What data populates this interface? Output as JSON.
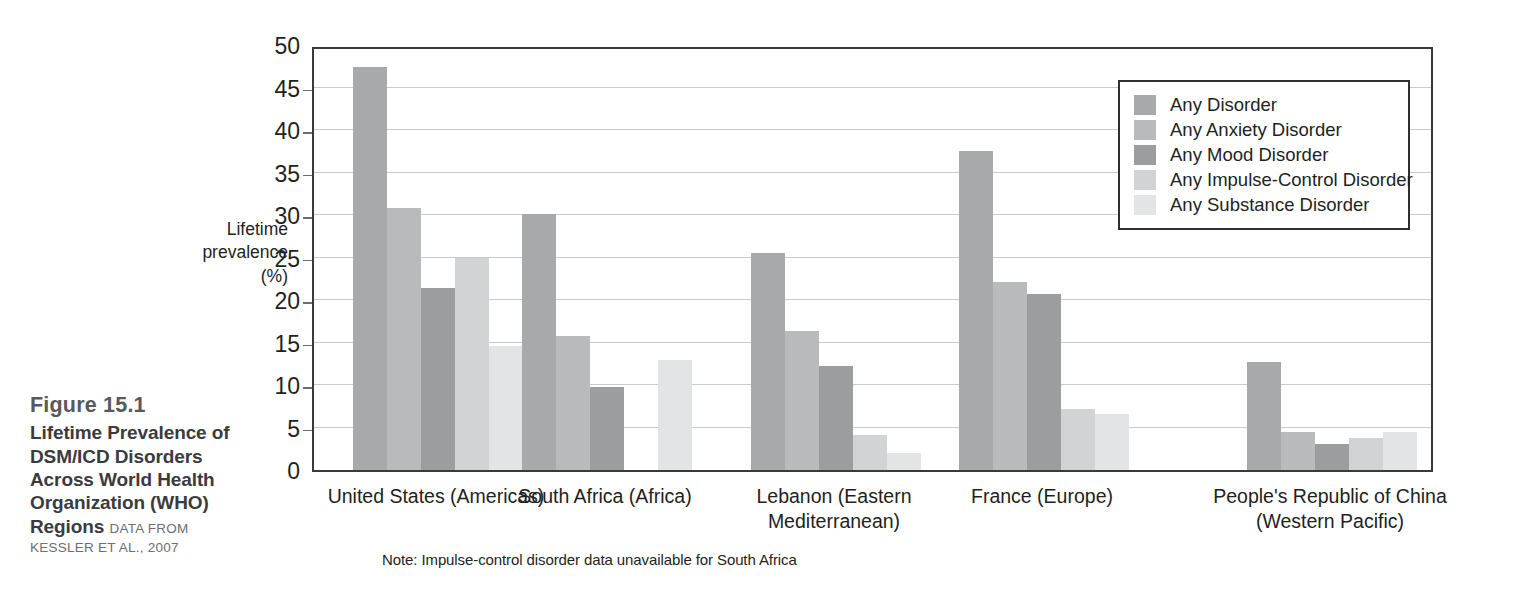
{
  "figure": {
    "number": "Figure 15.1",
    "title": "Lifetime Prevalence of DSM/ICD Disorders Across World Health Organization (WHO) Regions",
    "source_lead": "DATA FROM",
    "source_rest": "KESSLER ET AL., 2007"
  },
  "note": "Note: Impulse-control disorder data unavailable for South Africa",
  "chart_data": {
    "type": "bar",
    "title": "",
    "xlabel": "",
    "ylabel": "Lifetime prevalence (%)",
    "ylim": [
      0,
      50
    ],
    "yticks": [
      0,
      5,
      10,
      15,
      20,
      25,
      30,
      35,
      40,
      45,
      50
    ],
    "grid": true,
    "legend_position": "top-right",
    "categories": [
      "United States (Americas)",
      "South Africa (Africa)",
      "Lebanon (Eastern Mediterranean)",
      "France (Europe)",
      "People's Republic of China (Western Pacific)"
    ],
    "category_lines": [
      [
        "United States (Americas)"
      ],
      [
        "South Africa (Africa)"
      ],
      [
        "Lebanon (Eastern",
        "Mediterranean)"
      ],
      [
        "France (Europe)"
      ],
      [
        "People's Republic of China",
        "(Western Pacific)"
      ]
    ],
    "series": [
      {
        "name": "Any Disorder",
        "color": "#a8a9ab",
        "values": [
          47.4,
          30.1,
          25.5,
          37.5,
          12.7
        ]
      },
      {
        "name": "Any Anxiety Disorder",
        "color": "#b9babc",
        "values": [
          30.8,
          15.8,
          16.4,
          22.1,
          4.5
        ]
      },
      {
        "name": "Any Mood Disorder",
        "color": "#9c9d9f",
        "values": [
          21.4,
          9.8,
          12.2,
          20.7,
          3.1
        ]
      },
      {
        "name": "Any Impulse-Control Disorder",
        "color": "#d2d3d4",
        "values": [
          25.0,
          null,
          4.1,
          7.2,
          3.8
        ]
      },
      {
        "name": "Any Substance Disorder",
        "color": "#e3e4e5",
        "values": [
          14.6,
          13.0,
          2.0,
          6.6,
          4.5
        ]
      }
    ]
  }
}
